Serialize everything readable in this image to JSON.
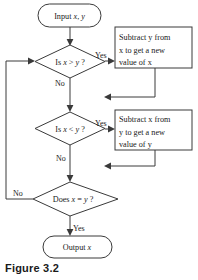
{
  "figure": {
    "caption": "Figure 3.2",
    "type": "flowchart"
  },
  "nodes": {
    "input_terminal": {
      "shape": "terminator",
      "label": "Input x, y",
      "text_plain": "Input ",
      "text_italic_1": "x",
      "text_mid": ", ",
      "text_italic_2": "y"
    },
    "decision_greater": {
      "shape": "diamond",
      "label": "Is x > y ?",
      "prefix": "Is ",
      "var_left": "x",
      "operator": " > ",
      "var_right": "y",
      "suffix": " ?"
    },
    "process_subtract_y": {
      "shape": "process",
      "label": "Subtract y from x to get a new value of x",
      "line1_a": "Subtract ",
      "line1_var": "y",
      "line1_b": " from",
      "line2_var": "x",
      "line2_b": " to get a new",
      "line3_a": "value of ",
      "line3_var": "x"
    },
    "decision_less": {
      "shape": "diamond",
      "label": "Is x < y ?",
      "prefix": "Is ",
      "var_left": "x",
      "operator": " < ",
      "var_right": "y",
      "suffix": " ?"
    },
    "process_subtract_x": {
      "shape": "process",
      "label": "Subtract x from y to get a new value of y",
      "line1_a": "Subtract ",
      "line1_var": "x",
      "line1_b": " from",
      "line2_var": "y",
      "line2_b": " to get a new",
      "line3_a": "value of ",
      "line3_var": "y"
    },
    "decision_equal": {
      "shape": "diamond",
      "label": "Does x = y ?",
      "prefix": "Does ",
      "var_left": "x",
      "operator": " = ",
      "var_right": "y",
      "suffix": " ?"
    },
    "output_terminal": {
      "shape": "terminator",
      "label": "Output x",
      "text_plain": "Output ",
      "text_italic_1": "x"
    }
  },
  "edge_labels": {
    "greater_yes": "Yes",
    "greater_no": "No",
    "less_yes": "Yes",
    "less_no": "No",
    "equal_yes": "Yes",
    "equal_no": "No"
  },
  "colors": {
    "stroke": "#3a3a3a",
    "text": "#1a1a1a",
    "background": "#ffffff",
    "caption": "#1a1a1a"
  }
}
